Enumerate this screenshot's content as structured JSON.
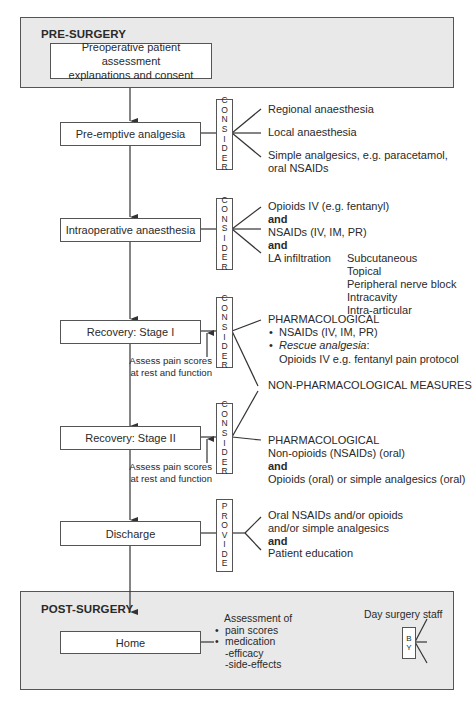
{
  "pre_surgery": {
    "title": "PRE-SURGERY",
    "assessment_box": {
      "line1": "Preoperative patient assessment",
      "line2": "explanations and consent"
    }
  },
  "stages": [
    {
      "label": "Pre-emptive analgesia",
      "action": [
        "C",
        "O",
        "N",
        "S",
        "I",
        "D",
        "E",
        "R"
      ],
      "options": [
        "Regional anaesthesia",
        "Local anaesthesia",
        "Simple analgesics, e.g. paracetamol,",
        "oral NSAIDs"
      ]
    },
    {
      "label": "Intraoperative anaesthesia",
      "action": [
        "C",
        "O",
        "N",
        "S",
        "I",
        "D",
        "E",
        "R"
      ],
      "options": [
        "Opioids IV (e.g. fentanyl)",
        "and",
        "NSAIDs (IV, IM, PR)",
        "and",
        "LA infiltration"
      ],
      "la_infiltration_routes": [
        "Subcutaneous",
        "Topical",
        "Peripheral nerve block",
        "Intracavity",
        "Intra-articular"
      ]
    },
    {
      "label": "Recovery: Stage I",
      "action": [
        "C",
        "O",
        "N",
        "S",
        "I",
        "D",
        "E",
        "R"
      ],
      "assess_note": [
        "Assess pain scores",
        "at rest and function"
      ],
      "pharmacological": {
        "heading": "PHARMACOLOGICAL",
        "bullets": [
          "NSAIDs (IV, IM, PR)",
          "Rescue analgesia"
        ],
        "rescue_suffix": ":",
        "rescue_detail": "Opioids IV e.g. fentanyl pain protocol"
      }
    },
    {
      "label": "Recovery: Stage II",
      "action": [
        "C",
        "O",
        "N",
        "S",
        "I",
        "D",
        "E",
        "R"
      ],
      "assess_note": [
        "Assess pain scores",
        "at rest and function"
      ],
      "pharmacological": {
        "heading": "PHARMACOLOGICAL",
        "lines": [
          "Non-opioids (NSAIDs) (oral)",
          "and",
          "Opioids (oral) or simple analgesics (oral)"
        ]
      }
    },
    {
      "label": "Discharge",
      "action": [
        "P",
        "R",
        "O",
        "V",
        "I",
        "D",
        "E"
      ],
      "options": [
        "Oral NSAIDs and/or opioids",
        "and/or simple analgesics",
        "and",
        "Patient education"
      ]
    }
  ],
  "non_pharmacological": "NON-PHARMACOLOGICAL MEASURES",
  "post_surgery": {
    "title": "POST-SURGERY",
    "home_label": "Home",
    "assessment": {
      "heading": "Assessment of",
      "bullets": [
        "pain scores",
        "medication"
      ],
      "sub_items": [
        "-efficacy",
        "-side-effects"
      ]
    },
    "by": [
      "B",
      "Y"
    ],
    "providers": [
      "Day surgery staff",
      "(telephone call)",
      "District nurses",
      "General",
      "practitioners"
    ]
  },
  "colors": {
    "panel_fill": "#e9e9e9",
    "line": "#333333",
    "box_fill": "#ffffff"
  }
}
